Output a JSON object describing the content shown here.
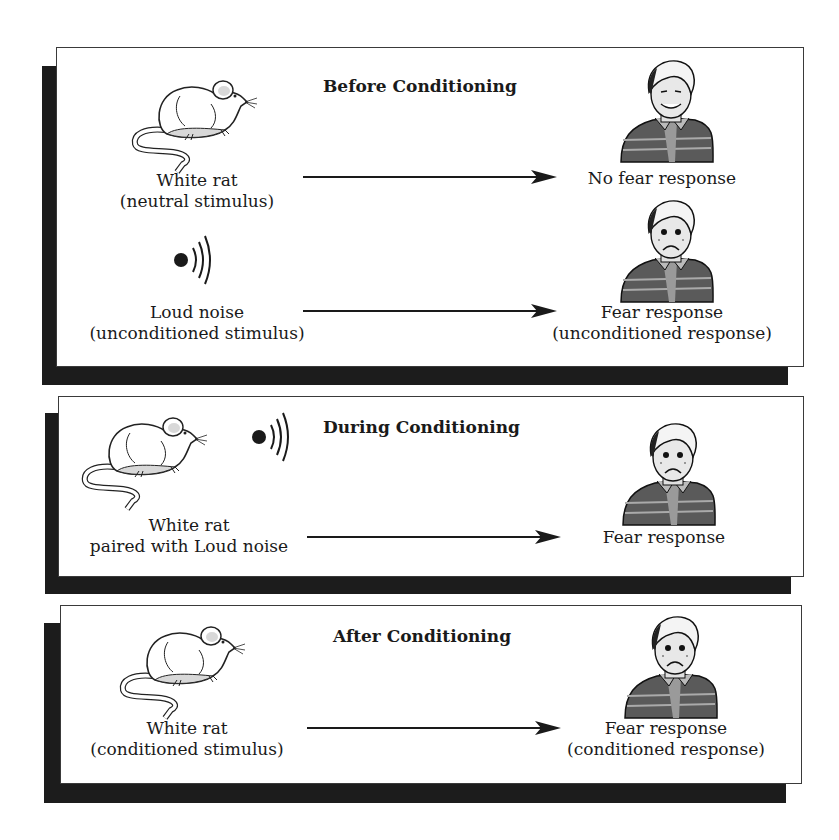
{
  "panels": [
    {
      "title": "Before Conditioning",
      "rows": [
        {
          "stimulus_icon": "rat-icon",
          "stimulus_line1": "White rat",
          "stimulus_line2": "(neutral stimulus)",
          "response_icon": "smiling-boy-icon",
          "response_line1": "No fear response",
          "response_line2": ""
        },
        {
          "stimulus_icon": "loud-noise-icon",
          "stimulus_line1": "Loud noise",
          "stimulus_line2": "(unconditioned stimulus)",
          "response_icon": "frightened-boy-icon",
          "response_line1": "Fear response",
          "response_line2": "(unconditioned response)"
        }
      ]
    },
    {
      "title": "During Conditioning",
      "rows": [
        {
          "stimulus_icon": "rat-and-noise-icon",
          "stimulus_line1": "White rat",
          "stimulus_line2": "paired with Loud noise",
          "response_icon": "frightened-boy-icon",
          "response_line1": "Fear response",
          "response_line2": ""
        }
      ]
    },
    {
      "title": "After Conditioning",
      "rows": [
        {
          "stimulus_icon": "rat-icon",
          "stimulus_line1": "White rat",
          "stimulus_line2": "(conditioned stimulus)",
          "response_icon": "frightened-boy-icon",
          "response_line1": "Fear response",
          "response_line2": "(conditioned response)"
        }
      ]
    }
  ],
  "colors": {
    "shadow": "#1c1c1c",
    "border": "#3a3a3a",
    "shirt": "#5a5a5a",
    "rat_shade": "#d8d8d8"
  }
}
